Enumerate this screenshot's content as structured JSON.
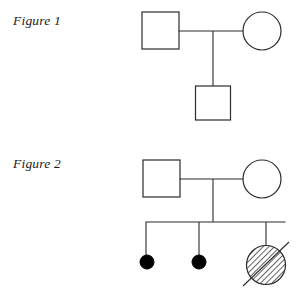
{
  "page": {
    "background_color": "#ffffff",
    "width": 304,
    "height": 290,
    "stroke_color": "#2b2b2b",
    "fill_affected_color": "#000000",
    "hatch_color": "#3a3a3a"
  },
  "figures": [
    {
      "label": "Figure 1",
      "label_position": {
        "x": 13,
        "y": 14
      },
      "generations": [
        {
          "name": "generation-I",
          "individuals": [
            {
              "id": "fig1-I-1",
              "shape": "square",
              "sex": "male",
              "status": "unaffected",
              "deceased": false,
              "center": {
                "x": 160,
                "y": 30
              },
              "size": 37
            },
            {
              "id": "fig1-I-2",
              "shape": "circle",
              "sex": "female",
              "status": "unaffected",
              "deceased": false,
              "center": {
                "x": 262,
                "y": 31
              },
              "size": 38
            }
          ]
        },
        {
          "name": "generation-II",
          "individuals": [
            {
              "id": "fig1-II-1",
              "shape": "square",
              "sex": "male",
              "status": "unaffected",
              "deceased": false,
              "center": {
                "x": 213,
                "y": 103
              },
              "size": 35
            }
          ]
        }
      ],
      "connections": [
        {
          "type": "mating-line",
          "from": "fig1-I-1",
          "to": "fig1-I-2",
          "y": 31
        },
        {
          "type": "descent-line",
          "x": 213,
          "from_y": 31,
          "to_y": 86
        }
      ]
    },
    {
      "label": "Figure 2",
      "label_position": {
        "x": 13,
        "y": 157
      },
      "generations": [
        {
          "name": "generation-I",
          "individuals": [
            {
              "id": "fig2-I-1",
              "shape": "square",
              "sex": "male",
              "status": "unaffected",
              "deceased": false,
              "center": {
                "x": 161,
                "y": 178
              },
              "size": 37
            },
            {
              "id": "fig2-I-2",
              "shape": "circle",
              "sex": "female",
              "status": "unaffected",
              "deceased": false,
              "center": {
                "x": 262,
                "y": 179
              },
              "size": 38
            }
          ]
        },
        {
          "name": "generation-II",
          "individuals": [
            {
              "id": "fig2-II-1",
              "shape": "circle",
              "sex": "female",
              "status": "affected",
              "fill": "solid",
              "deceased": false,
              "center": {
                "x": 147,
                "y": 262
              },
              "size": 14
            },
            {
              "id": "fig2-II-2",
              "shape": "circle",
              "sex": "female",
              "status": "affected",
              "fill": "solid",
              "deceased": false,
              "center": {
                "x": 199,
                "y": 262
              },
              "size": 14
            },
            {
              "id": "fig2-II-3",
              "shape": "circle",
              "sex": "female",
              "status": "carrier-or-variant",
              "fill": "hatched",
              "deceased": true,
              "center": {
                "x": 266,
                "y": 265
              },
              "size": 39
            }
          ]
        }
      ],
      "connections": [
        {
          "type": "mating-line",
          "from": "fig2-I-1",
          "to": "fig2-I-2",
          "y": 179
        },
        {
          "type": "descent-line",
          "x": 213,
          "from_y": 179,
          "to_y": 222
        },
        {
          "type": "sibship-line",
          "y": 222,
          "from_x": 146,
          "to_x": 285
        },
        {
          "type": "sibling-drop",
          "x": 146,
          "from_y": 222,
          "to_y": 255
        },
        {
          "type": "sibling-drop",
          "x": 199,
          "from_y": 222,
          "to_y": 255
        },
        {
          "type": "sibling-drop",
          "x": 266,
          "from_y": 222,
          "to_y": 246
        }
      ]
    }
  ]
}
